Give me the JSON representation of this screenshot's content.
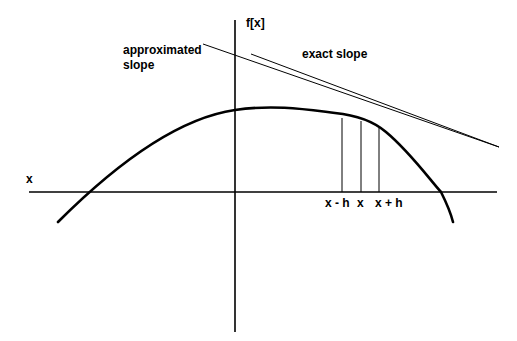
{
  "labels": {
    "y_axis": "f[x]",
    "x_axis": "x",
    "approx_line1": "approximated",
    "approx_line2": "slope",
    "exact": "exact slope",
    "x_minus_h": "x - h",
    "x_center": "x",
    "x_plus_h": "x + h"
  },
  "colors": {
    "stroke": "#000000",
    "background": "#ffffff"
  }
}
